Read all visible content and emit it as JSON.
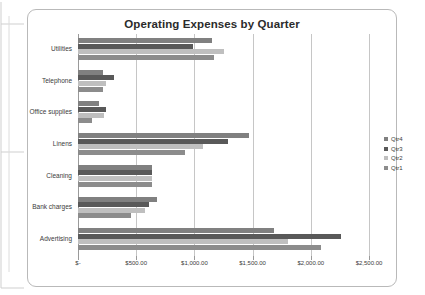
{
  "chart_data": {
    "type": "bar",
    "orientation": "horizontal",
    "title": "Operating Expenses by Quarter",
    "xlabel": "",
    "ylabel": "",
    "categories": [
      "Utilities",
      "Telephone",
      "Office supplies",
      "Linens",
      "Cleaning",
      "Bank charges",
      "Advertising"
    ],
    "series": [
      {
        "name": "Qtr1",
        "color": "#8c8c8c",
        "values": [
          1165,
          215,
          120,
          920,
          640,
          455,
          2085
        ]
      },
      {
        "name": "Qtr2",
        "color": "#bfbfbf",
        "values": [
          1255,
          240,
          225,
          1070,
          640,
          575,
          1800
        ]
      },
      {
        "name": "Qtr3",
        "color": "#595959",
        "values": [
          990,
          310,
          240,
          1285,
          640,
          610,
          2260
        ]
      },
      {
        "name": "Qtr4",
        "color": "#808080",
        "values": [
          1155,
          215,
          180,
          1465,
          640,
          680,
          1680
        ]
      }
    ],
    "legend": {
      "position": "right",
      "entries": [
        {
          "label": "Qtr4",
          "color": "#808080"
        },
        {
          "label": "Qtr3",
          "color": "#595959"
        },
        {
          "label": "Qtr2",
          "color": "#bfbfbf"
        },
        {
          "label": "Qtr1",
          "color": "#8c8c8c"
        }
      ]
    },
    "xlim": [
      0,
      2500
    ],
    "xticks": [
      0,
      500,
      1000,
      1500,
      2000,
      2500
    ],
    "xtick_labels": [
      "$-",
      "$500.00",
      "$1,000.00",
      "$1,500.00",
      "$2,000.00",
      "$2,500.00"
    ],
    "grid": true
  }
}
